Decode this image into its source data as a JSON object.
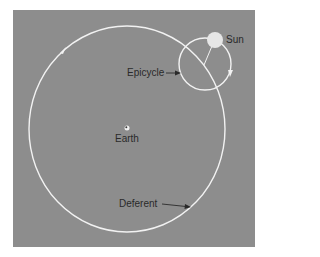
{
  "diagram": {
    "labels": {
      "sun": "Sun",
      "epicycle": "Epicycle",
      "earth": "Earth",
      "deferent": "Deferent"
    },
    "colors": {
      "background": "#8d8d8d",
      "orbit_lines": "#f2f2f2",
      "sun": "#e6e6e6",
      "earth": "#f0f0f0",
      "text": "#2a2a2a"
    },
    "geometry": {
      "deferent": {
        "cx": 127,
        "cy": 129,
        "rx": 98,
        "ry": 103
      },
      "epicycle": {
        "cx": 205,
        "cy": 64,
        "r": 26
      },
      "sun": {
        "cx": 215,
        "cy": 40,
        "r": 8
      },
      "earth": {
        "cx": 127,
        "cy": 128,
        "r": 2.5
      }
    }
  }
}
